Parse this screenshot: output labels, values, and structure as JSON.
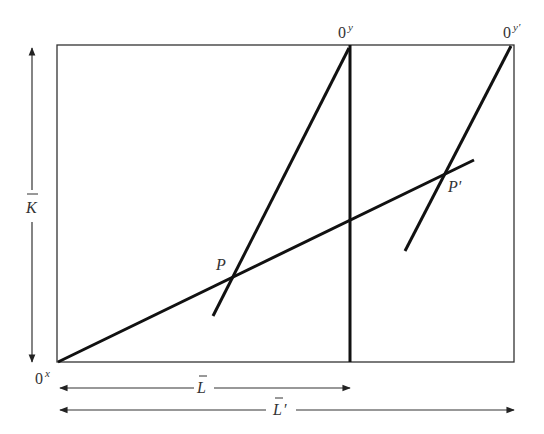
{
  "diagram": {
    "origins": {
      "x_origin": {
        "base": "0",
        "sup": "x"
      },
      "y_origin": {
        "base": "0",
        "sup": "y"
      },
      "y_origin_prime": {
        "base": "0",
        "sup": "y′"
      }
    },
    "points": {
      "p": "P",
      "p_prime": "P′"
    },
    "dimensions": {
      "k_bar": "K",
      "l_bar": "L",
      "l_bar_prime": "L",
      "l_bar_prime_mark": "′"
    }
  }
}
